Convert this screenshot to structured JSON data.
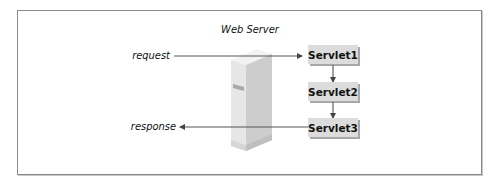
{
  "diagram": {
    "server_label": "Web Server",
    "request_label": "request",
    "response_label": "response",
    "servlets": [
      "Servlet1",
      "Servlet2",
      "Servlet3"
    ],
    "colors": {
      "box_fill": "#dcdcdc",
      "box_shadow": "#a8a8a8",
      "line": "#555555",
      "server_front": "#e4e4e4",
      "server_side": "#cfcfcf",
      "server_top": "#f2f2f2",
      "server_slot": "#a9a9a9"
    }
  }
}
